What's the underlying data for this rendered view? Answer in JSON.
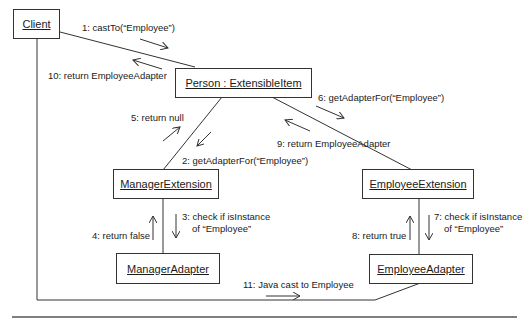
{
  "objects": {
    "client": "Client",
    "person": "Person : ExtensibleItem",
    "manager_extension": "ManagerExtension",
    "employee_extension": "EmployeeExtension",
    "manager_adapter": "ManagerAdapter",
    "employee_adapter": "EmployeeAdapter"
  },
  "messages": {
    "m1": "1: castTo(“Employee”)",
    "m2": "2: getAdapterFor(“Employee”)",
    "m3a": "3: check if isInstance",
    "m3b": "of “Employee”",
    "m4": "4: return false",
    "m5": "5: return null",
    "m6": "6: getAdapterFor(“Employee”)",
    "m7a": "7: check if isInstance",
    "m7b": "of “Employee”",
    "m8": "8: return true",
    "m9": "9: return EmployeeAdapter",
    "m10": "10: return EmployeeAdapter",
    "m11": "11: Java cast to Employee"
  }
}
